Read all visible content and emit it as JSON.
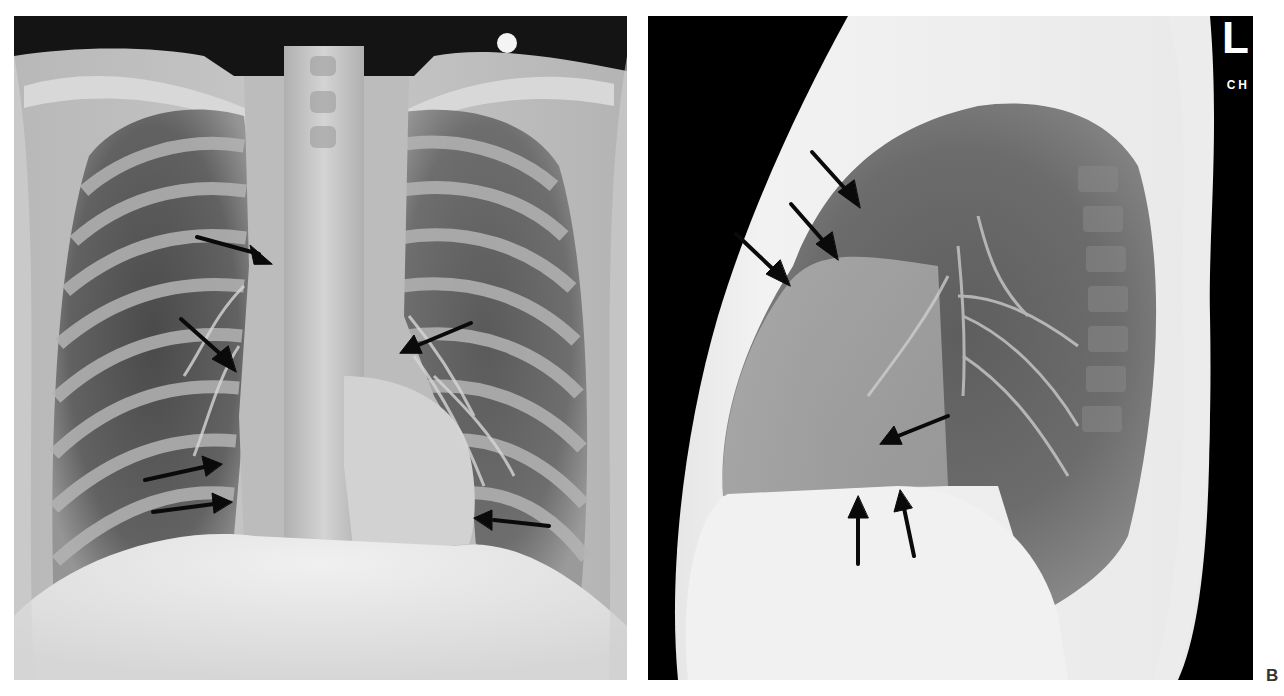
{
  "figure": {
    "panels": [
      {
        "id": "A",
        "view": "posteroanterior chest radiograph",
        "arrow_count": 7,
        "arrows": [
          {
            "tip": [
              272,
              262
            ],
            "direction": "right-down"
          },
          {
            "tip": [
              236,
              372
            ],
            "direction": "down-right"
          },
          {
            "tip": [
              400,
              352
            ],
            "direction": "left-down"
          },
          {
            "tip": [
              222,
              464
            ],
            "direction": "right"
          },
          {
            "tip": [
              232,
              502
            ],
            "direction": "right"
          },
          {
            "tip": [
              474,
              520
            ],
            "direction": "left"
          }
        ]
      },
      {
        "id": "B",
        "view": "lateral chest radiograph",
        "side_marker": "L",
        "tech_marker": "CH",
        "arrows": [
          {
            "tip": [
              862,
              210
            ],
            "direction": "down-right"
          },
          {
            "tip": [
              840,
              262
            ],
            "direction": "down-right"
          },
          {
            "tip": [
              790,
              286
            ],
            "direction": "down-right"
          },
          {
            "tip": [
              878,
              444
            ],
            "direction": "left-down"
          },
          {
            "tip": [
              858,
              490
            ],
            "direction": "up"
          },
          {
            "tip": [
              900,
              480
            ],
            "direction": "up"
          }
        ]
      }
    ],
    "panel_label": "B",
    "colors": {
      "background": "#ffffff",
      "film_dark": "#000000",
      "arrow": "#0a0a0a",
      "bone": "#e8e8e8"
    }
  }
}
